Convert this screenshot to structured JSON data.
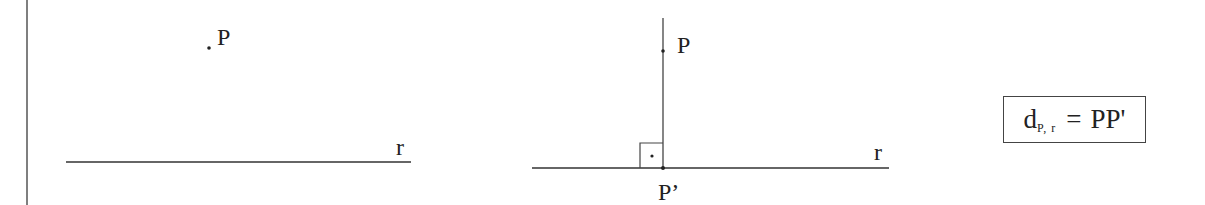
{
  "figure_left": {
    "point_label": "P",
    "line_label": "r"
  },
  "figure_right": {
    "point_label": "P",
    "foot_label": "P’",
    "line_label": "r",
    "right_angle_marker": "right-angle-square-with-dot"
  },
  "formula": {
    "main": "d",
    "subscript": "P, r",
    "equals": "=",
    "rhs": "PP'"
  },
  "colors": {
    "ink": "#222222",
    "background": "#ffffff"
  }
}
